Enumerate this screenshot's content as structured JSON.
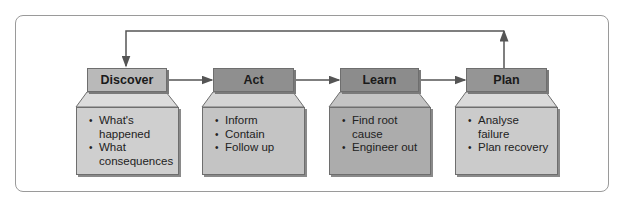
{
  "diagram": {
    "stages": [
      {
        "title": "Discover",
        "items": [
          "What's happened",
          "What consequences"
        ],
        "header_color": "#b9b9b9",
        "body_color": "#cfcfcf"
      },
      {
        "title": "Act",
        "items": [
          "Inform",
          "Contain",
          "Follow up"
        ],
        "header_color": "#8f8f8f",
        "body_color": "#c4c4c4"
      },
      {
        "title": "Learn",
        "items": [
          "Find root cause",
          "Engineer out"
        ],
        "header_color": "#8c8c8c",
        "body_color": "#acacac"
      },
      {
        "title": "Plan",
        "items": [
          "Analyse failure",
          "Plan recovery"
        ],
        "header_color": "#959595",
        "body_color": "#cbcbcb"
      }
    ],
    "connections": [
      {
        "from": "Discover",
        "to": "Act"
      },
      {
        "from": "Act",
        "to": "Learn"
      },
      {
        "from": "Learn",
        "to": "Plan"
      },
      {
        "from": "Plan",
        "to": "Discover",
        "type": "feedback-loop"
      }
    ]
  }
}
